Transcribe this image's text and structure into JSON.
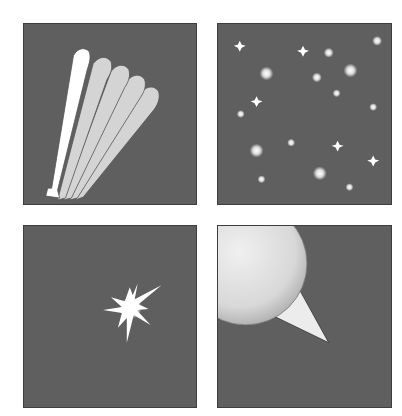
{
  "figure": {
    "panels": [
      {
        "id": "top-left",
        "subject": "comet-tail-fan",
        "description": "Fan of five elongated rounded strips, leftmost white, others light gray"
      },
      {
        "id": "top-right",
        "subject": "star-field",
        "description": "Scattered white stars and glowing dots"
      },
      {
        "id": "bottom-left",
        "subject": "bright-star-burst",
        "description": "Single bright spiky starburst"
      },
      {
        "id": "bottom-right",
        "subject": "comet-head-with-tail",
        "description": "Large shaded sphere with tapering triangular tail"
      }
    ],
    "colors": {
      "background": "#5f5f5f",
      "border": "#3e3e3e",
      "white": "#ffffff",
      "light_gray": "#d4d4d4"
    }
  }
}
